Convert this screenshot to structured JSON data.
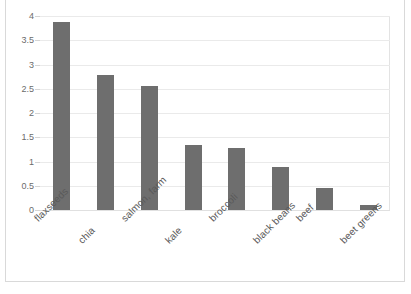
{
  "chart_data": {
    "type": "bar",
    "title": "",
    "xlabel": "",
    "ylabel": "",
    "ylim": [
      0,
      4
    ],
    "ytick_values": [
      4,
      3.5,
      3,
      2.5,
      2,
      1.5,
      1,
      0.5,
      0
    ],
    "ytick_labels": [
      "4",
      "3.5",
      "3",
      "2.5",
      "2",
      "1.5",
      "1",
      "0.5",
      "0"
    ],
    "grid": true,
    "legend": "none",
    "categories": [
      "flaxseeds",
      "chia",
      "salmon, farm",
      "kale",
      "broccoli",
      "black beans",
      "beef",
      "beet greens"
    ],
    "values": [
      3.87,
      2.78,
      2.55,
      1.34,
      1.27,
      0.88,
      0.45,
      0.1
    ],
    "series": [
      {
        "name": "series-1",
        "values": [
          3.87,
          2.78,
          2.55,
          1.34,
          1.27,
          0.88,
          0.45,
          0.1
        ]
      }
    ]
  },
  "style": {
    "bar_color": "#6E6E6E",
    "grid_color": "#EAEAEA",
    "axis_text_color": "#595959",
    "frame_color": "#D9D9D9",
    "background": "#FFFFFF"
  }
}
